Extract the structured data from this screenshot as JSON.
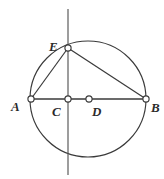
{
  "figure": {
    "type": "circle-geometry-diagram",
    "background_color": "#ffffff",
    "stroke_color": "#3a3a3a",
    "label_color": "#2b2b2b",
    "node_fill_color": "#ffffff",
    "circle": {
      "center_x": 88,
      "center_y": 99,
      "radius": 58
    },
    "points": [
      {
        "id": "A",
        "label": "A",
        "x": 31,
        "y": 99
      },
      {
        "id": "C",
        "label": "C",
        "x": 68,
        "y": 99
      },
      {
        "id": "D",
        "label": "D",
        "x": 89,
        "y": 99
      },
      {
        "id": "B",
        "label": "B",
        "x": 146,
        "y": 99
      },
      {
        "id": "E",
        "label": "E",
        "x": 68,
        "y": 48
      }
    ],
    "segments": [
      {
        "id": "chord-AB",
        "from": "A",
        "to": "B"
      },
      {
        "id": "chord-EA",
        "from": "E",
        "to": "A"
      },
      {
        "id": "chord-EB",
        "from": "E",
        "to": "B"
      },
      {
        "id": "segment-EC",
        "from": "E",
        "to": "C"
      }
    ],
    "vertical_line": {
      "id": "vertical-line-through-E-and-C",
      "x": 68,
      "y_top": 9,
      "y_bottom": 175
    }
  }
}
